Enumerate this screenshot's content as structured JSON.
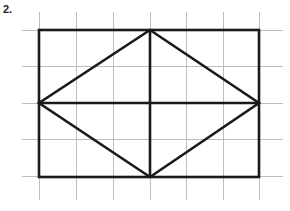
{
  "problem": {
    "number_label": "2.",
    "figure_title": "Rhombus inscribed in a rectangle on grid paper"
  },
  "canvas": {
    "width": 290,
    "height": 211,
    "background_color": "#ffffff"
  },
  "grid": {
    "label": "graph-paper-grid",
    "line_color": "#bdbdbd",
    "line_width": 1,
    "cell_width": 37,
    "cell_height": 36,
    "vertical_lines_x": [
      39,
      76,
      113,
      150,
      186,
      223,
      259
    ],
    "horizontal_lines_y": [
      30,
      66,
      103,
      139,
      176
    ],
    "vertical_span_y": [
      12,
      200
    ],
    "horizontal_span_x": [
      22,
      283
    ]
  },
  "figure": {
    "stroke_color": "#1a1a1a",
    "stroke_width": 2.6,
    "rectangle": {
      "label": "bounding-rectangle",
      "x": 39,
      "y": 30,
      "width": 220,
      "height": 147,
      "left": 39,
      "top": 30,
      "right": 259,
      "bottom": 177
    },
    "rhombus": {
      "label": "inscribed-rhombus",
      "vertices": [
        {
          "name": "top",
          "x": 150,
          "y": 30
        },
        {
          "name": "right",
          "x": 259,
          "y": 103
        },
        {
          "name": "bottom",
          "x": 150,
          "y": 177
        },
        {
          "name": "left",
          "x": 39,
          "y": 103
        }
      ]
    },
    "diagonals": [
      {
        "name": "horizontal-diagonal",
        "x1": 39,
        "y1": 103,
        "x2": 259,
        "y2": 103
      },
      {
        "name": "vertical-diagonal",
        "x1": 150,
        "y1": 30,
        "x2": 150,
        "y2": 177
      }
    ],
    "center_point": {
      "x": 150,
      "y": 103
    }
  }
}
